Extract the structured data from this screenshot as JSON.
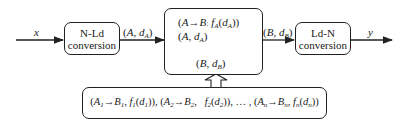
{
  "diagram": {
    "input_label": "x",
    "output_label": "y",
    "n_ld_box": {
      "line1": "N-Ld",
      "line2": "conversion"
    },
    "ld_n_box": {
      "line1": "Ld-N",
      "line2": "conversion"
    },
    "edge_after_n_ld": "(A, d_A)",
    "edge_after_center": "(B, d_B)",
    "center_box": {
      "rule_line": "(A→B, f_A(d_A))",
      "input_line": "(A, d_A)",
      "output_line": "(B, d_B)"
    },
    "rule_base_box": {
      "text": "(A1→B1, f1(d1)), (A2→B2, f2(d2)), … , (An→Bn, fn(dn))"
    },
    "colors": {
      "line": "#222222",
      "background": "#ffffff"
    }
  }
}
